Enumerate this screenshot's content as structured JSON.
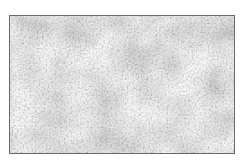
{
  "image": {
    "description": "Grayscale fine-grained natural texture (dense foliage / canopy-like speckle pattern) inside a thin dark rectangular border",
    "colors": {
      "background": "#ffffff",
      "border": "#6a6a6a",
      "texture_light": "#f4f4f4",
      "texture_dark": "#5a5a5a"
    }
  }
}
